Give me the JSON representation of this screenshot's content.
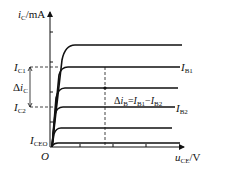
{
  "diagram": {
    "y_axis": {
      "var": "i",
      "sub": "C",
      "unit": "/mA"
    },
    "x_axis": {
      "var": "u",
      "sub": "CE",
      "unit": "/V"
    },
    "origin": "O",
    "labels": {
      "ic1": {
        "var": "I",
        "sub": "C1"
      },
      "ic2": {
        "var": "I",
        "sub": "C2"
      },
      "delta_ic": {
        "prefix": "Δ",
        "var": "i",
        "sub": "C"
      },
      "iceo": {
        "var": "I",
        "sub": "CEO"
      },
      "ib1": {
        "var": "I",
        "sub": "B1"
      },
      "ib2": {
        "var": "I",
        "sub": "B2"
      },
      "delta_ib": {
        "prefix": "Δ",
        "var": "i",
        "sub": "B",
        "eq": "=",
        "a_var": "I",
        "a_sub": "B1",
        "minus": "−",
        "b_var": "I",
        "b_sub": "B2"
      }
    },
    "colors": {
      "line": "#111111",
      "background": "#ffffff"
    }
  }
}
